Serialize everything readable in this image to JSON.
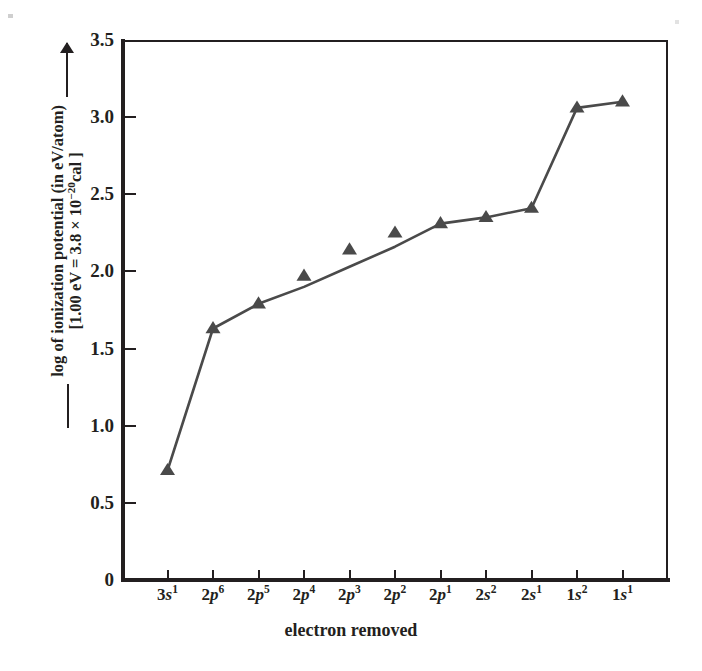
{
  "chart_data": {
    "type": "line",
    "title": "",
    "xlabel": "electron removed",
    "ylabel_line1": "log of ionization potential (in eV/atom)",
    "ylabel_line2": "[1.00 eV = 3.8 × 10⁻²⁰ cal ]",
    "categories": [
      "3s1",
      "2p6",
      "2p5",
      "2p4",
      "2p3",
      "2p2",
      "2p1",
      "2s2",
      "2s1",
      "1s2",
      "1s1"
    ],
    "category_labels": [
      {
        "base": "3",
        "orbital": "s",
        "sup": "1"
      },
      {
        "base": "2",
        "orbital": "p",
        "sup": "6"
      },
      {
        "base": "2",
        "orbital": "p",
        "sup": "5"
      },
      {
        "base": "2",
        "orbital": "p",
        "sup": "4"
      },
      {
        "base": "2",
        "orbital": "p",
        "sup": "3"
      },
      {
        "base": "2",
        "orbital": "p",
        "sup": "2"
      },
      {
        "base": "2",
        "orbital": "p",
        "sup": "1"
      },
      {
        "base": "2",
        "orbital": "s",
        "sup": "2"
      },
      {
        "base": "2",
        "orbital": "s",
        "sup": "1"
      },
      {
        "base": "1",
        "orbital": "s",
        "sup": "2"
      },
      {
        "base": "1",
        "orbital": "s",
        "sup": "1"
      }
    ],
    "values": [
      0.71,
      1.63,
      1.79,
      1.97,
      2.14,
      2.25,
      2.31,
      2.35,
      2.41,
      3.06,
      3.1
    ],
    "marker_values": [
      0.71,
      1.63,
      1.79,
      1.97,
      2.14,
      2.25,
      2.31,
      2.35,
      2.41,
      3.06,
      3.1
    ],
    "line_values": [
      0.71,
      1.63,
      1.79,
      1.9,
      2.03,
      2.16,
      2.31,
      2.35,
      2.41,
      3.06,
      3.1
    ],
    "ylim": [
      0,
      3.5
    ],
    "ytick_values": [
      0,
      0.5,
      1.0,
      1.5,
      2.0,
      2.5,
      3.0,
      3.5
    ],
    "ytick_labels": [
      "0",
      "0.5",
      "1.0",
      "1.5",
      "2.0",
      "2.5",
      "3.0",
      "3.5"
    ],
    "grid": false,
    "legend": "none",
    "marker": "triangle-up",
    "series_color": "#4a4a4a",
    "axis_color": "#231f20",
    "background_color": "#ffffff"
  }
}
